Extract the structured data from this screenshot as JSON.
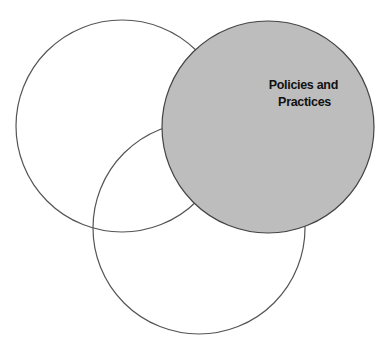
{
  "diagram": {
    "type": "venn",
    "circles": [
      {
        "id": "top-left",
        "label": "",
        "filled": false
      },
      {
        "id": "bottom",
        "label": "",
        "filled": false
      },
      {
        "id": "top-right",
        "label_lines": [
          "Policies and",
          "Practices"
        ],
        "filled": true
      }
    ],
    "colors": {
      "highlight_fill": "#bdbdbd",
      "stroke": "#444444",
      "background": "#ffffff"
    }
  }
}
